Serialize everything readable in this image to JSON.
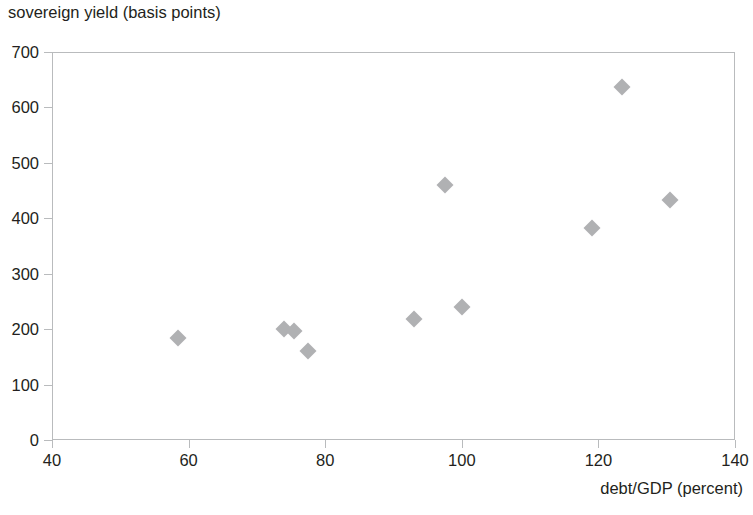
{
  "chart_data": {
    "type": "scatter",
    "title": "",
    "xlabel": "debt/GDP (percent)",
    "ylabel": "sovereign yield (basis points)",
    "xlim": [
      40,
      140
    ],
    "ylim": [
      0,
      700
    ],
    "xticks": [
      40,
      60,
      80,
      100,
      120,
      140
    ],
    "yticks": [
      0,
      100,
      200,
      300,
      400,
      500,
      600,
      700
    ],
    "xtick_labels": [
      "40",
      "60",
      "80",
      "100",
      "120",
      "140"
    ],
    "ytick_labels": [
      "0",
      "100",
      "200",
      "300",
      "400",
      "500",
      "600",
      "700"
    ],
    "grid": false,
    "legend": false,
    "marker": "diamond",
    "marker_color": "#b0b1b3",
    "axis_color": "#b9bbbd",
    "text_color": "#231f20",
    "background": "#ffffff",
    "series": [
      {
        "name": "countries",
        "points": [
          {
            "x": 58.5,
            "y": 184
          },
          {
            "x": 74.0,
            "y": 200
          },
          {
            "x": 75.5,
            "y": 196
          },
          {
            "x": 77.5,
            "y": 161
          },
          {
            "x": 93.0,
            "y": 218
          },
          {
            "x": 97.5,
            "y": 460
          },
          {
            "x": 100.0,
            "y": 240
          },
          {
            "x": 119.0,
            "y": 383
          },
          {
            "x": 123.5,
            "y": 637
          },
          {
            "x": 130.5,
            "y": 433
          }
        ]
      }
    ]
  },
  "axis_titles": {
    "y": "sovereign yield (basis points)",
    "x": "debt/GDP (percent)"
  }
}
